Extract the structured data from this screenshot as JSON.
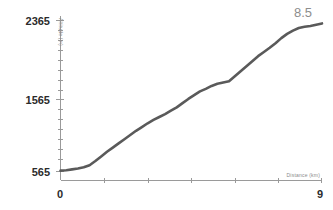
{
  "chart_data": {
    "type": "line",
    "title": "",
    "xlabel": "Distance (km)",
    "ylabel": "Altitude (m)",
    "xlim": [
      0,
      9
    ],
    "ylim": [
      565,
      2365
    ],
    "grid": false,
    "legend": null,
    "annotations": [
      {
        "text": "8.5",
        "position": "top-right"
      }
    ],
    "x_tick_labels": [
      "0",
      "9"
    ],
    "y_tick_labels": [
      "565",
      "1565",
      "2365"
    ],
    "x_minor_tick_interval": 1.5,
    "series": [
      {
        "name": "Elevation profile",
        "color": "#5a5a5a",
        "x": [
          0.0,
          0.2,
          0.4,
          0.6,
          0.8,
          1.0,
          1.2,
          1.4,
          1.6,
          1.8,
          2.0,
          2.2,
          2.4,
          2.6,
          2.8,
          3.0,
          3.2,
          3.4,
          3.6,
          3.8,
          4.0,
          4.2,
          4.4,
          4.6,
          4.8,
          5.0,
          5.2,
          5.4,
          5.6,
          5.8,
          6.0,
          6.2,
          6.4,
          6.6,
          6.8,
          7.0,
          7.2,
          7.4,
          7.6,
          7.8,
          8.0,
          8.2,
          8.4,
          8.6,
          8.8,
          9.0
        ],
        "y": [
          575,
          580,
          590,
          600,
          615,
          640,
          690,
          745,
          800,
          850,
          900,
          950,
          1000,
          1050,
          1095,
          1140,
          1180,
          1215,
          1250,
          1290,
          1330,
          1380,
          1430,
          1475,
          1520,
          1550,
          1585,
          1610,
          1625,
          1640,
          1700,
          1760,
          1820,
          1880,
          1940,
          1990,
          2040,
          2095,
          2155,
          2205,
          2245,
          2275,
          2290,
          2300,
          2315,
          2330
        ]
      }
    ]
  },
  "axes": {
    "y_label": "Altitude (m)",
    "x_label": "Distance (km)",
    "y_ticks": [
      "2365",
      "1565",
      "565"
    ],
    "x_ticks": [
      "0",
      "9"
    ]
  },
  "annotation": {
    "value": "8.5"
  },
  "colors": {
    "line": "#5a5a5a",
    "axis": "#9a9a9a",
    "tick_text": "#2b2b2b",
    "axis_title": "#8a8a8a",
    "annotation": "#8d8d8d",
    "background": "#ffffff"
  }
}
